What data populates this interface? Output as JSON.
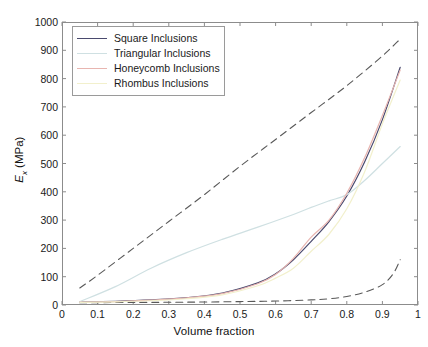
{
  "chart_data": {
    "type": "line",
    "title": "",
    "xlabel": "Volume fraction",
    "ylabel": "E_x (MPa)",
    "ylabel_base": "E",
    "ylabel_sub": "x",
    "ylabel_unit": " (MPa)",
    "xlim": [
      0,
      1
    ],
    "ylim": [
      0,
      1000
    ],
    "grid": false,
    "legend_position": "top-left",
    "xticks": [
      "0",
      "0.1",
      "0.2",
      "0.3",
      "0.4",
      "0.5",
      "0.6",
      "0.7",
      "0.8",
      "0.9",
      "1"
    ],
    "xtick_values": [
      0,
      0.1,
      0.2,
      0.3,
      0.4,
      0.5,
      0.6,
      0.7,
      0.8,
      0.9,
      1
    ],
    "yticks": [
      "0",
      "100",
      "200",
      "300",
      "400",
      "500",
      "600",
      "700",
      "800",
      "900",
      "1000"
    ],
    "ytick_values": [
      0,
      100,
      200,
      300,
      400,
      500,
      600,
      700,
      800,
      900,
      1000
    ],
    "legend": [
      {
        "label": "Square Inclusions",
        "color": "#4a4a6e"
      },
      {
        "label": "Triangular Inclusions",
        "color": "#cfe0e2"
      },
      {
        "label": "Honeycomb Inclusions",
        "color": "#e8b5b0"
      },
      {
        "label": "Rhombus Inclusions",
        "color": "#f2f0cc"
      }
    ],
    "series": [
      {
        "name": "Voigt upper bound",
        "color": "#595959",
        "style": "dashed",
        "in_legend": false,
        "x": [
          0.05,
          0.1,
          0.2,
          0.3,
          0.4,
          0.5,
          0.6,
          0.7,
          0.8,
          0.9,
          0.95
        ],
        "values": [
          60,
          105,
          200,
          295,
          390,
          490,
          585,
          680,
          775,
          880,
          940
        ]
      },
      {
        "name": "Reuss lower bound",
        "color": "#595959",
        "style": "dashed",
        "in_legend": false,
        "x": [
          0.05,
          0.2,
          0.35,
          0.5,
          0.6,
          0.7,
          0.75,
          0.8,
          0.85,
          0.9,
          0.93,
          0.95
        ],
        "values": [
          8,
          9,
          10,
          12,
          14,
          18,
          22,
          30,
          45,
          72,
          110,
          160
        ]
      },
      {
        "name": "Square Inclusions",
        "color": "#4a4a6e",
        "style": "solid",
        "in_legend": true,
        "x": [
          0.05,
          0.15,
          0.25,
          0.35,
          0.45,
          0.55,
          0.6,
          0.65,
          0.7,
          0.75,
          0.8,
          0.85,
          0.9,
          0.95
        ],
        "values": [
          10,
          13,
          18,
          26,
          42,
          78,
          110,
          160,
          225,
          295,
          385,
          505,
          655,
          840
        ]
      },
      {
        "name": "Triangular Inclusions",
        "color": "#cfe0e2",
        "style": "solid",
        "in_legend": true,
        "x": [
          0.05,
          0.15,
          0.25,
          0.35,
          0.45,
          0.55,
          0.65,
          0.7,
          0.75,
          0.8,
          0.85,
          0.9,
          0.95
        ],
        "values": [
          12,
          65,
          130,
          185,
          232,
          275,
          320,
          345,
          368,
          390,
          440,
          500,
          560
        ]
      },
      {
        "name": "Honeycomb Inclusions",
        "color": "#e8b5b0",
        "style": "solid",
        "in_legend": true,
        "x": [
          0.05,
          0.15,
          0.25,
          0.35,
          0.45,
          0.55,
          0.6,
          0.65,
          0.7,
          0.75,
          0.8,
          0.85,
          0.9,
          0.95
        ],
        "values": [
          10,
          12,
          17,
          25,
          40,
          75,
          108,
          165,
          240,
          300,
          395,
          520,
          670,
          830
        ]
      },
      {
        "name": "Rhombus Inclusions",
        "color": "#f2f0cc",
        "style": "solid",
        "in_legend": true,
        "x": [
          0.05,
          0.15,
          0.25,
          0.35,
          0.45,
          0.55,
          0.6,
          0.65,
          0.7,
          0.75,
          0.8,
          0.85,
          0.9,
          0.95
        ],
        "values": [
          9,
          11,
          15,
          22,
          36,
          68,
          95,
          130,
          190,
          250,
          340,
          470,
          640,
          795
        ]
      }
    ]
  }
}
